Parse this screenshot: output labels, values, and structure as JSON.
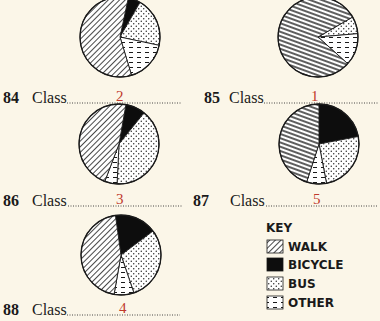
{
  "chart_data": {
    "type": "pie",
    "title": "",
    "legend": {
      "title": "KEY",
      "placement": "bottom-right",
      "entries": [
        {
          "key": "walk",
          "label": "WALK",
          "pattern": "diagonal-hatch"
        },
        {
          "key": "bicycle",
          "label": "BICYCLE",
          "pattern": "solid-black"
        },
        {
          "key": "bus",
          "label": "BUS",
          "pattern": "dots"
        },
        {
          "key": "other",
          "label": "OTHER",
          "pattern": "horizontal-dashes"
        }
      ]
    },
    "categories": [
      "walk",
      "bicycle",
      "bus",
      "other"
    ],
    "charts": [
      {
        "question": "84",
        "label": "Class",
        "answer": "2",
        "values": {
          "walk": 58,
          "bicycle": 5,
          "bus": 20,
          "other": 17
        }
      },
      {
        "question": "85",
        "label": "Class",
        "answer": "1",
        "values": {
          "walk": 80,
          "bicycle": 0,
          "bus": 7,
          "other": 13
        }
      },
      {
        "question": "86",
        "label": "Class",
        "answer": "3",
        "values": {
          "walk": 47,
          "bicycle": 8,
          "bus": 40,
          "other": 5
        }
      },
      {
        "question": "87",
        "label": "Class",
        "answer": "5",
        "values": {
          "walk": 45,
          "bicycle": 22,
          "bus": 25,
          "other": 8
        }
      },
      {
        "question": "88",
        "label": "Class",
        "answer": "4",
        "values": {
          "walk": 45,
          "bicycle": 17,
          "bus": 30,
          "other": 8
        }
      }
    ],
    "units": "percent (estimated)"
  },
  "colors": {
    "background": "#fbf6e8",
    "ink": "#1a1a1a",
    "answer": "#c0392b"
  }
}
